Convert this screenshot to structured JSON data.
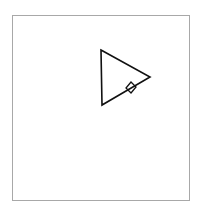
{
  "canvas": {
    "width": 202,
    "height": 213,
    "background": "#ffffff",
    "frame_color": "#a8a8a8"
  },
  "shapes": {
    "triangle": {
      "points": "101,50 150,77 102,105",
      "stroke": "#111111"
    },
    "diamond": {
      "points": "131,82 136,87 131,93 126,88",
      "stroke": "#111111"
    }
  }
}
